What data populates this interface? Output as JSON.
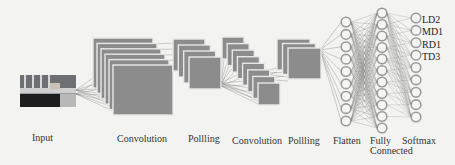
{
  "diagram": {
    "type": "cnn-architecture",
    "colors": {
      "background": "#f3f3f1",
      "feature_map_fill": "#8c8c8c",
      "feature_map_edge": "#e8e8e8",
      "node_stroke": "#9a9a9a",
      "connection": "#777777",
      "text": "#333333"
    },
    "stages": [
      {
        "id": "input",
        "label": "Input",
        "kind": "image"
      },
      {
        "id": "conv1",
        "label": "Convolution",
        "kind": "feature-maps",
        "maps": 6
      },
      {
        "id": "pool1",
        "label": "Pollling",
        "kind": "feature-maps",
        "maps": 4
      },
      {
        "id": "conv2",
        "label": "Convolution",
        "kind": "feature-maps",
        "maps": 8
      },
      {
        "id": "pool2",
        "label": "Pollling",
        "kind": "feature-maps",
        "maps": 3
      },
      {
        "id": "flatten",
        "label": "Flatten",
        "kind": "neurons",
        "nodes": 9
      },
      {
        "id": "fc",
        "label": "Fully",
        "label2": "Connected",
        "kind": "neurons",
        "nodes": 11
      },
      {
        "id": "softmax",
        "label": "Softmax",
        "kind": "neurons",
        "nodes": 9
      }
    ],
    "output_classes": [
      "LD2",
      "MD1",
      "RD1",
      "TD3"
    ]
  }
}
